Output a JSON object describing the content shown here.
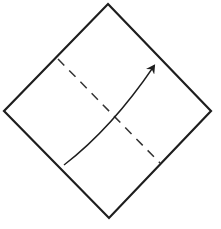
{
  "diagram": {
    "type": "origami-fold-step",
    "colors": {
      "background": "#ffffff",
      "stroke": "#1e1e1e",
      "dashed": "#333333"
    },
    "paper": {
      "shape": "square rotated 45 degrees (diamond)",
      "vertices": [
        [
          108,
          4
        ],
        [
          211,
          111
        ],
        [
          109,
          218
        ],
        [
          4,
          111
        ]
      ]
    },
    "fold_line": {
      "style": "dashed (valley fold)",
      "from": [
        58,
        59
      ],
      "to": [
        160,
        163
      ]
    },
    "arrow": {
      "meaning": "fold bottom-left half up toward top-right",
      "start": [
        64,
        165
      ],
      "control": [
        112,
        128
      ],
      "end": [
        154,
        66
      ]
    }
  }
}
